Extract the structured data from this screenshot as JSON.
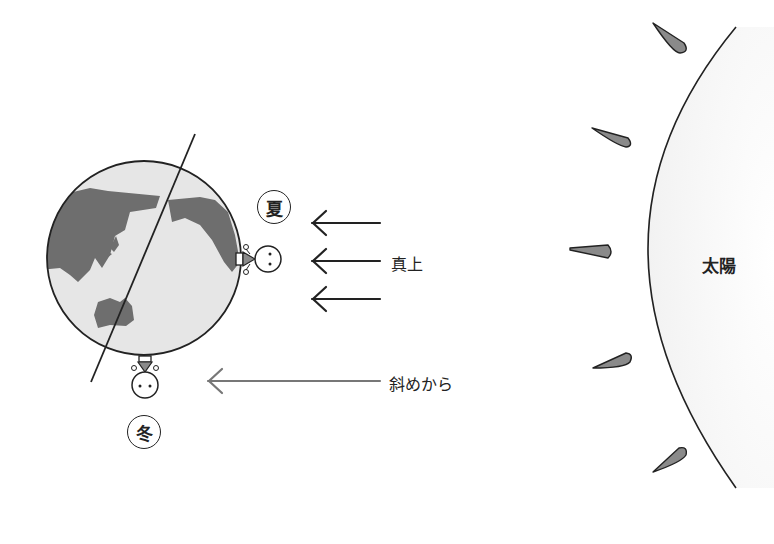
{
  "diagram": {
    "earth": {
      "label": "Earth with tilted axis",
      "colors": {
        "ocean": "#e6e6e6",
        "land": "#6e6e6e",
        "outline": "#222222"
      }
    },
    "sun": {
      "label": "太陽",
      "colors": {
        "fill": "#f7f7f7",
        "outline": "#222222",
        "ray": "#8a8a8a"
      }
    },
    "summer": {
      "badge": "夏",
      "arrow_label": "真上"
    },
    "winter": {
      "badge": "冬",
      "arrow_label": "斜めから"
    },
    "colors": {
      "arrow_summer": "#222222",
      "arrow_winter": "#777777"
    }
  }
}
